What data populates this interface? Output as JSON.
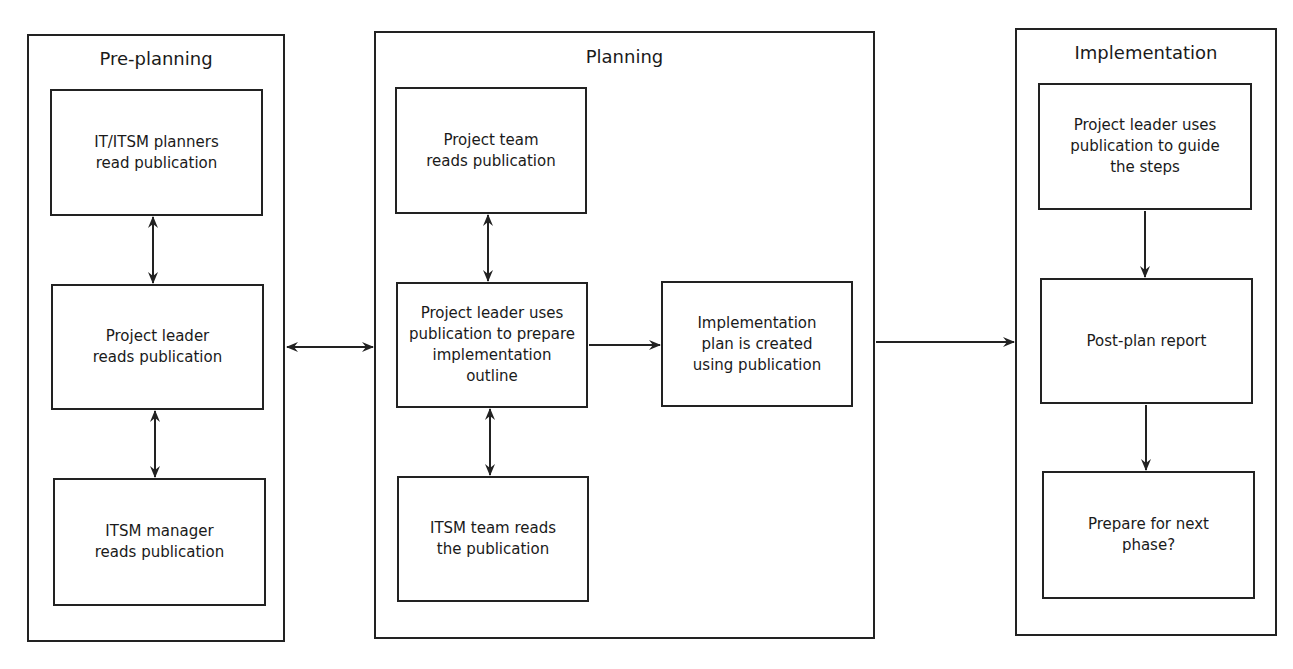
{
  "phases": [
    {
      "title": "Pre-planning",
      "boxes": [
        {
          "label": "IT/ITSM planners\nread publication"
        },
        {
          "label": "Project leader\nreads publication"
        },
        {
          "label": "ITSM manager\nreads publication"
        }
      ]
    },
    {
      "title": "Planning",
      "boxes": [
        {
          "label": "Project team\nreads publication"
        },
        {
          "label": "Project leader uses\npublication to prepare\nimplementation\noutline"
        },
        {
          "label": "ITSM team reads\nthe publication"
        },
        {
          "label": "Implementation\nplan is created\nusing publication"
        }
      ]
    },
    {
      "title": "Implementation",
      "boxes": [
        {
          "label": "Project leader uses\npublication to guide\nthe steps"
        },
        {
          "label": "Post-plan report"
        },
        {
          "label": "Prepare for next\nphase?"
        }
      ]
    }
  ],
  "colors": {
    "line": "#222222",
    "background": "#ffffff"
  }
}
